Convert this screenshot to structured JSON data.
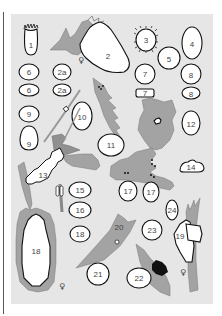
{
  "figure": {
    "type": "identification plate",
    "colors": {
      "background": "#e6e6e6",
      "leaf": "#a3a3a3",
      "egg_fill": "#ffffff",
      "outline": "#111111",
      "label": "#444444"
    },
    "labels": {
      "e1": "1",
      "e2": "2",
      "e2a_top": "2a",
      "e2a_bottom": "2a",
      "e3": "3",
      "e4": "4",
      "e5": "5",
      "e6_top": "6",
      "e6_bottom": "6",
      "e7_top": "7",
      "e7_bottom": "7",
      "e8_top": "8",
      "e8_bottom": "8",
      "e9_top": "9",
      "e9_bottom": "9",
      "e10": "10",
      "e11": "11",
      "e12": "12",
      "e13": "13",
      "e14": "14",
      "e15": "15",
      "e16": "16",
      "e17_left": "17",
      "e17_right": "17",
      "e18_large": "18",
      "e18_small": "18",
      "e19": "19",
      "e20": "20",
      "e21": "21",
      "e22": "22",
      "e23": "23",
      "e24": "24"
    },
    "symbols": {
      "female_2": "♀",
      "female_18": "♀",
      "female_19": "♀"
    }
  }
}
